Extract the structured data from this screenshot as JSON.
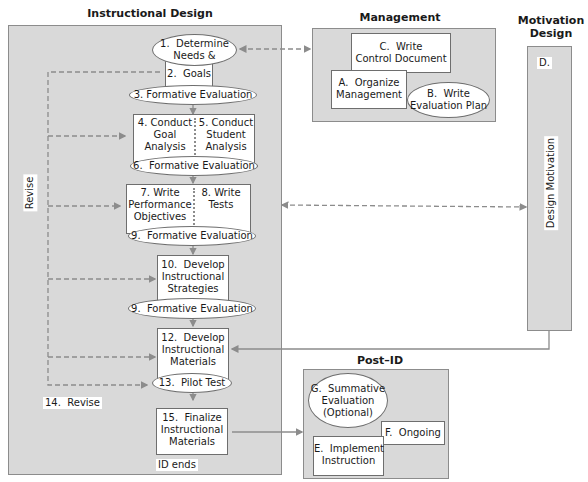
{
  "sections": {
    "instructional_design": {
      "title": "Instructional Design",
      "revise_vertical_label": "Revise",
      "revise_step_label": "14.  Revise",
      "end_label": "ID ends",
      "steps": {
        "s1": "1.  Determine\nNeeds &",
        "s2": "2.  Goals",
        "s3": "3. Formative Evaluation",
        "s4": "4. Conduct\nGoal\nAnalysis",
        "s5": "5. Conduct\nStudent\nAnalysis",
        "s6": "6.  Formative Evaluation",
        "s7": "7. Write\nPerformance\nObjectives",
        "s8": "8. Write\nTests",
        "s9a": "9.  Formative Evaluation",
        "s10": "10.  Develop\nInstructional\nStrategies",
        "s9b": "9.  Formative Evaluation",
        "s12": "12.  Develop\nInstructional\nMaterials",
        "s13": "13.  Pilot Test",
        "s15": "15.  Finalize\nInstructional\nMaterials"
      }
    },
    "management": {
      "title": "Management",
      "steps": {
        "c": "C.  Write\nControl Document",
        "a": "A.  Organize\nManagement",
        "b": "B.  Write\nEvaluation Plan"
      }
    },
    "motivation_design": {
      "title": "Motivation\nDesign",
      "step_label": "D.",
      "vertical_label": "Design Motivation"
    },
    "post_id": {
      "title": "Post–ID",
      "steps": {
        "g": "G.  Summative\nEvaluation\n(Optional)",
        "f": "F.  Ongoing",
        "e": "E.  Implement\nInstruction"
      }
    }
  },
  "colors": {
    "panel_fill": "#d9d9d9",
    "panel_border": "#8c8c8c",
    "box_fill": "#ffffff",
    "arrow": "#8c8c8c"
  }
}
